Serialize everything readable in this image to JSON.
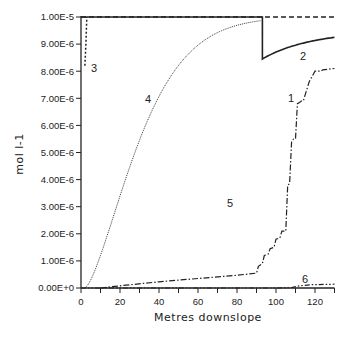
{
  "chart_data": {
    "type": "line",
    "title": "",
    "xlabel": "Metres downslope",
    "ylabel": "mol l-1",
    "xlim": [
      0,
      130
    ],
    "ylim": [
      0,
      1e-05
    ],
    "grid": false,
    "legend": "inline numeric labels 1-6",
    "x_ticks": [
      "0",
      "20",
      "40",
      "60",
      "80",
      "100",
      "120"
    ],
    "y_ticks": [
      "0.00E+0",
      "1.00E-6",
      "2.00E-6",
      "3.00E-6",
      "4.00E-6",
      "5.00E-6",
      "6.00E-6",
      "7.00E-6",
      "8.00E-6",
      "9.00E-6",
      "1.00E-5"
    ],
    "series": [
      {
        "name": "1",
        "style": "solid",
        "x": [
          0,
          93,
          93,
          100,
          110,
          120,
          130
        ],
        "values": [
          1e-05,
          1e-05,
          8.45e-06,
          8.65e-06,
          8.9e-06,
          9.1e-06,
          9.25e-06
        ]
      },
      {
        "name": "2",
        "style": "dashed",
        "x": [
          0,
          93,
          130
        ],
        "values": [
          1e-05,
          1e-05,
          1e-05
        ]
      },
      {
        "name": "3",
        "style": "dotted",
        "x": [
          2,
          2.5,
          3
        ],
        "values": [
          8.2e-06,
          9e-06,
          1e-05
        ]
      },
      {
        "name": "4",
        "style": "dotted-fine",
        "x": [
          2,
          10,
          20,
          30,
          40,
          50,
          60,
          70,
          80,
          90
        ],
        "values": [
          1e-07,
          2.3e-06,
          4.6e-06,
          6.6e-06,
          8.1e-06,
          9e-06,
          9.5e-06,
          9.8e-06,
          9.95e-06,
          1e-05
        ]
      },
      {
        "name": "5",
        "style": "dash-dot",
        "x": [
          10,
          20,
          40,
          60,
          80,
          90,
          91,
          93,
          94,
          96,
          97,
          99,
          100,
          102,
          103,
          105,
          106,
          107,
          108,
          109,
          110,
          111,
          112,
          113,
          114,
          117,
          120,
          123,
          124,
          130
        ],
        "values": [
          0.0,
          8e-08,
          2.3e-07,
          3.5e-07,
          4.7e-07,
          5.5e-07,
          8e-07,
          9e-07,
          1.2e-06,
          1.25e-06,
          1.45e-06,
          1.5e-06,
          1.8e-06,
          1.85e-06,
          2.1e-06,
          2.1e-06,
          3.8e-06,
          3.85e-06,
          5.4e-06,
          5.5e-06,
          5.5e-06,
          6.8e-06,
          6.85e-06,
          6.9e-06,
          6.9e-06,
          7.6e-06,
          8e-06,
          8e-06,
          8.05e-06,
          8.1e-06
        ]
      },
      {
        "name": "6",
        "style": "dash-dot-dot",
        "x": [
          0,
          100,
          108,
          112,
          118,
          130
        ],
        "values": [
          0.0,
          0.0,
          1e-08,
          8e-08,
          1.2e-07,
          1.4e-07
        ]
      }
    ]
  },
  "labels": {
    "xlabel": "Metres downslope",
    "ylabel": "mol l-1",
    "series_labels": [
      "1",
      "2",
      "3",
      "4",
      "5",
      "6"
    ]
  }
}
